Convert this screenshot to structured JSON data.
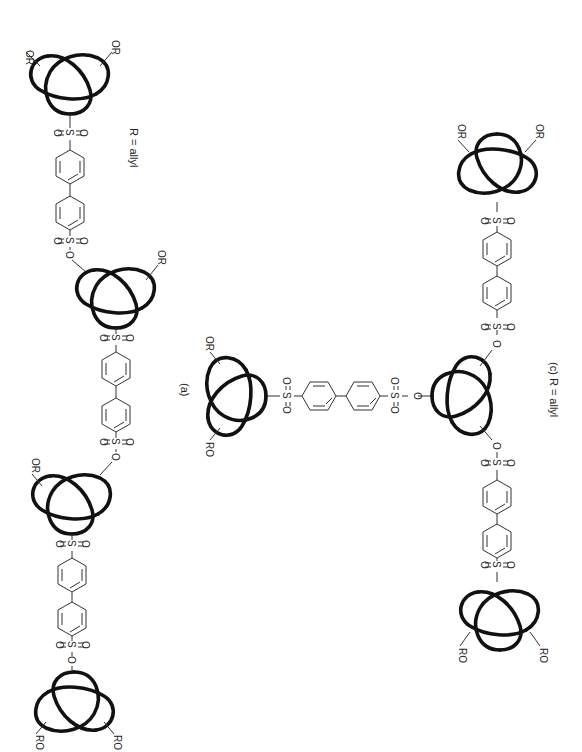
{
  "figure": {
    "orientation": "rotated 90 degrees clockwise",
    "background": "#ffffff",
    "knot_color": "#111111",
    "bond_color": "#333333"
  },
  "labels": {
    "panel_a": "(a)",
    "panel_c": "(c) R = allyl",
    "left_legend": "R = allyl",
    "or": "OR",
    "ro": "RO",
    "oxygen": "O",
    "sulfur": "S"
  },
  "structures": {
    "left_chain": {
      "description": "linear polymer: trefoil knots linked by biphenyl disulfonate units",
      "knots": 4,
      "linkers": 3
    },
    "panel_a": {
      "description": "single trefoil knot with two OR groups and one biphenyl sulfonyl arm",
      "knots": 1,
      "linkers": 1
    },
    "panel_c": {
      "description": "branched: central trefoil linked by three biphenyl disulfonate arms to terminal knots",
      "knots": 3,
      "linkers": 2
    }
  }
}
